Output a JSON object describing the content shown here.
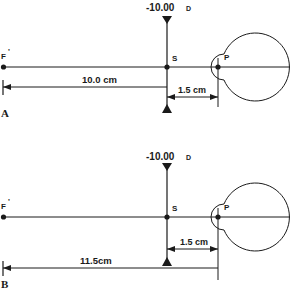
{
  "panels": [
    {
      "id": "A",
      "panel_label": "A",
      "lens_power": "-10.00",
      "lens_unit": "D",
      "focal_point_label": "F",
      "focal_point_prime": "'",
      "lens_point_label": "S",
      "eye_point_label": "P",
      "focal_distance_label": "10.0 cm",
      "vertex_distance_label": "1.5 cm"
    },
    {
      "id": "B",
      "panel_label": "B",
      "lens_power": "-10.00",
      "lens_unit": "D",
      "focal_point_label": "F",
      "focal_point_prime": "'",
      "lens_point_label": "S",
      "eye_point_label": "P",
      "focal_distance_label": "11.5cm",
      "vertex_distance_label": "1.5 cm"
    }
  ],
  "colors": {
    "ink": "#1a1a1a",
    "background": "#ffffff"
  }
}
